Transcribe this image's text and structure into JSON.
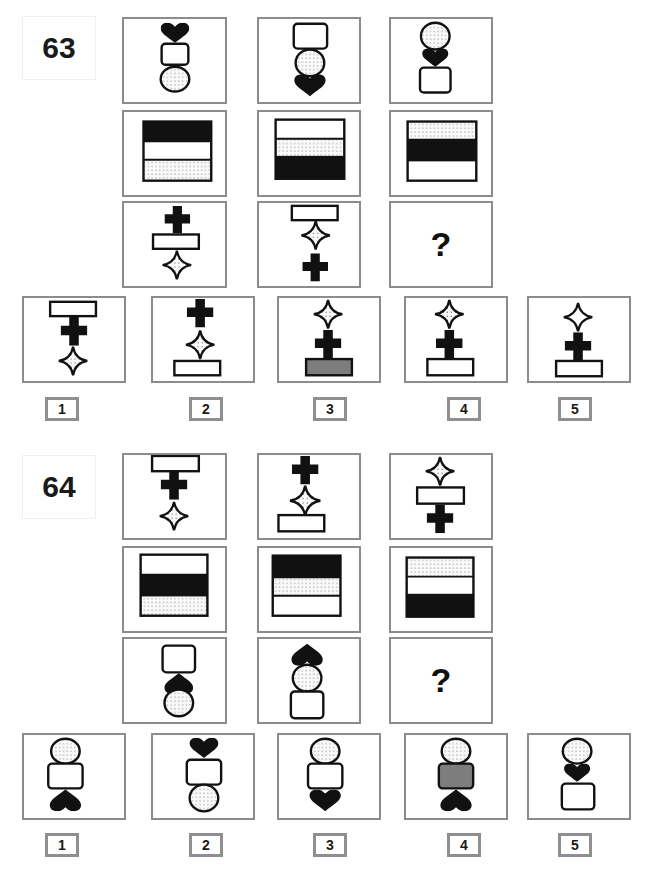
{
  "puzzles": [
    {
      "number": "63",
      "question_mark": "?",
      "answer_labels": [
        "1",
        "2",
        "3",
        "4",
        "5"
      ]
    },
    {
      "number": "64",
      "question_mark": "?",
      "answer_labels": [
        "1",
        "2",
        "3",
        "4",
        "5"
      ]
    }
  ],
  "colors": {
    "border": "#8c8c8c",
    "black_fill": "#111111",
    "gray_fill": "#7d7d7d",
    "dotted_bg": "#f2f2f2"
  },
  "icons": {
    "heart": "filled-heart",
    "circle": "dotted-circle",
    "rounded_rect": "white-rounded-rect",
    "cross": "black-cross",
    "star": "four-point-star",
    "bar": "white-bar",
    "stripes": "three-band-square"
  }
}
